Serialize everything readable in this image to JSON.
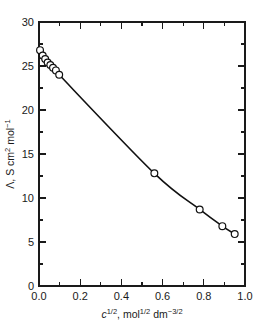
{
  "chart_data": {
    "type": "line",
    "title": "",
    "xlabel": "c^1/2, mol^1/2 dm^-3/2",
    "ylabel": "Λ, S cm^2 mol^-1",
    "xlim": [
      0.0,
      1.0
    ],
    "ylim": [
      0,
      30
    ],
    "grid": false,
    "legend": "none",
    "x_major_ticks": [
      0.0,
      0.2,
      0.4,
      0.6,
      0.8,
      1.0
    ],
    "x_major_tick_labels": [
      "0.0",
      "0.2",
      "0.4",
      "0.6",
      "0.8",
      "1.0"
    ],
    "x_minor_ticks": [
      0.1,
      0.3,
      0.5,
      0.7,
      0.9
    ],
    "y_major_ticks": [
      0,
      5,
      10,
      15,
      20,
      25,
      30
    ],
    "y_major_tick_labels": [
      "0",
      "5",
      "10",
      "15",
      "20",
      "25",
      "30"
    ],
    "y_minor_ticks": [
      2.5,
      7.5,
      12.5,
      17.5,
      22.5,
      27.5
    ],
    "series": [
      {
        "name": "Λ vs c^1/2",
        "marker": "open-circle",
        "line": "solid",
        "x": [
          0.005,
          0.018,
          0.03,
          0.042,
          0.055,
          0.068,
          0.082,
          0.098,
          0.56,
          0.78,
          0.89,
          0.95
        ],
        "y": [
          26.8,
          26.2,
          25.8,
          25.4,
          25.1,
          24.8,
          24.5,
          24.0,
          12.8,
          8.7,
          6.8,
          5.9
        ]
      }
    ]
  },
  "axis_titles": {
    "x_parts": {
      "c": "c",
      "c_exp": "1/2",
      "comma": ", mol",
      "mol_exp": "1/2",
      "dm": " dm",
      "dm_exp": "−3/2"
    },
    "y_parts": {
      "lambda": "Λ, S cm",
      "cm_exp": "2",
      "mol": " mol",
      "mol_exp": "−1"
    }
  }
}
